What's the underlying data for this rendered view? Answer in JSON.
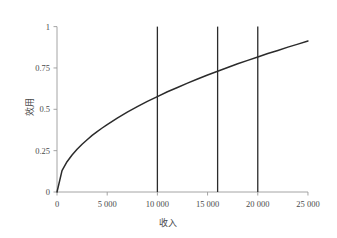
{
  "chart_data": {
    "type": "line",
    "title": "",
    "xlabel": "收入",
    "ylabel": "效用",
    "xlim": [
      0,
      26000
    ],
    "ylim": [
      0,
      1.04
    ],
    "grid": false,
    "legend": null,
    "x_ticks": [
      0,
      5000,
      10000,
      15000,
      20000,
      25000
    ],
    "x_tick_labels": [
      "0",
      "5 000",
      "10 000",
      "15 000",
      "20 000",
      "25 000"
    ],
    "y_ticks": [
      0,
      0.25,
      0.5,
      0.75,
      1
    ],
    "y_tick_labels": [
      "0",
      "0.25",
      "0.5",
      "0.75",
      "1"
    ],
    "series": [
      {
        "name": "utility-curve",
        "type": "line",
        "color": "#2b2b2b",
        "x": [
          0,
          500,
          1000,
          1500,
          2000,
          2500,
          3000,
          3500,
          4000,
          4500,
          5000,
          6000,
          7000,
          8000,
          9000,
          10000,
          11000,
          12000,
          13000,
          14000,
          15000,
          16000,
          17000,
          18000,
          19000,
          20000,
          21000,
          22000,
          23000,
          24000,
          25000
        ],
        "values": [
          0,
          0.129,
          0.183,
          0.224,
          0.258,
          0.289,
          0.316,
          0.342,
          0.365,
          0.387,
          0.408,
          0.447,
          0.483,
          0.516,
          0.548,
          0.577,
          0.606,
          0.632,
          0.658,
          0.683,
          0.707,
          0.73,
          0.753,
          0.775,
          0.796,
          0.816,
          0.837,
          0.856,
          0.876,
          0.894,
          0.913
        ]
      }
    ],
    "vertical_lines": [
      {
        "name": "reference-line-1",
        "x": 10000,
        "y_from": 0,
        "y_to": 1,
        "color": "#2b2b2b"
      },
      {
        "name": "reference-line-2",
        "x": 16000,
        "y_from": 0,
        "y_to": 1,
        "color": "#2b2b2b"
      },
      {
        "name": "reference-line-3",
        "x": 20000,
        "y_from": 0,
        "y_to": 1,
        "color": "#2b2b2b"
      }
    ],
    "axis_color": "#9a9a9a",
    "curve_color": "#2b2b2b",
    "background_color": "#ffffff"
  }
}
